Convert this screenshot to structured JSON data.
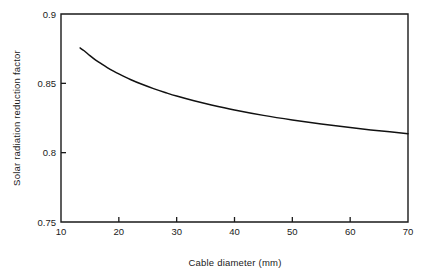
{
  "chart_data": {
    "type": "line",
    "title": "",
    "subtitle": "",
    "xlabel": "Cable diameter (mm)",
    "ylabel": "Solar radiation reduction factor",
    "xlim": [
      10,
      70
    ],
    "ylim": [
      0.75,
      0.9
    ],
    "xticks": [
      10,
      20,
      30,
      40,
      50,
      60,
      70
    ],
    "xticklabels": [
      "10",
      "20",
      "30",
      "40",
      "50",
      "60",
      "70"
    ],
    "yticks": [
      0.75,
      0.8,
      0.85,
      0.9
    ],
    "yticklabels": [
      "0.75",
      "0.8",
      "0.85",
      "0.9"
    ],
    "grid": false,
    "legend": false,
    "legend_position": "none",
    "frame": "box",
    "series": [
      {
        "name": "Solar radiation reduction factor",
        "color": "#111111",
        "x": [
          13.3,
          14,
          15,
          16,
          17,
          18,
          19,
          20,
          22,
          24,
          26,
          28,
          30,
          33,
          36,
          40,
          45,
          50,
          55,
          60,
          65,
          70
        ],
        "y": [
          0.8755,
          0.8735,
          0.87,
          0.8668,
          0.864,
          0.8614,
          0.859,
          0.8568,
          0.8528,
          0.8493,
          0.8462,
          0.8434,
          0.8408,
          0.8374,
          0.8344,
          0.8308,
          0.8269,
          0.8236,
          0.8207,
          0.8181,
          0.8158,
          0.8137
        ]
      }
    ]
  },
  "figure": {
    "plot_left_px": 61,
    "plot_top_px": 14,
    "plot_right_px": 408,
    "plot_bottom_px": 222
  }
}
